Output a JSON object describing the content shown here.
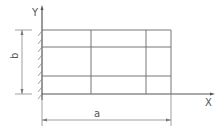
{
  "diagram": {
    "labels": {
      "y_axis": "Y",
      "x_axis": "X",
      "height_dim": "b",
      "width_dim": "a"
    },
    "grid": {
      "columns": 3,
      "rows": 3
    },
    "colors": {
      "line": "#777777",
      "axis": "#555555",
      "text": "#555555"
    }
  }
}
